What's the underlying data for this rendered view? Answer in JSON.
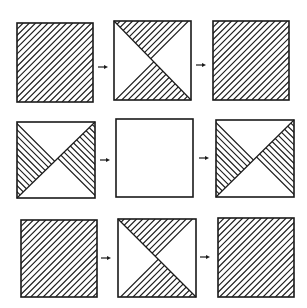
{
  "diagram": {
    "type": "pattern-matrix",
    "rows": 3,
    "cols": 3,
    "colors": {
      "stroke": "#1a1a1a",
      "background": "#ffffff"
    },
    "cells": [
      {
        "row": 0,
        "col": 0,
        "pattern": "full",
        "hatch": "forward",
        "box": [
          17,
          23,
          76,
          79
        ]
      },
      {
        "row": 0,
        "col": 1,
        "pattern": "top-bottom",
        "hatch": "forward",
        "diagonal": "tl-br",
        "box": [
          114,
          21,
          77,
          79
        ]
      },
      {
        "row": 0,
        "col": 2,
        "pattern": "full",
        "hatch": "forward",
        "box": [
          213,
          21,
          76,
          79
        ]
      },
      {
        "row": 1,
        "col": 0,
        "pattern": "left-right",
        "hatch": "back",
        "diagonal": "bl-tr",
        "box": [
          17,
          122,
          78,
          76
        ]
      },
      {
        "row": 1,
        "col": 1,
        "pattern": "empty",
        "box": [
          116,
          119,
          77,
          78
        ]
      },
      {
        "row": 1,
        "col": 2,
        "pattern": "left-right",
        "hatch": "back",
        "diagonal": "bl-tr",
        "box": [
          216,
          120,
          78,
          77
        ]
      },
      {
        "row": 2,
        "col": 0,
        "pattern": "full",
        "hatch": "forward",
        "box": [
          21,
          220,
          76,
          77
        ]
      },
      {
        "row": 2,
        "col": 1,
        "pattern": "top-bottom",
        "hatch": "forward",
        "diagonal": "tl-br",
        "box": [
          118,
          219,
          78,
          78
        ]
      },
      {
        "row": 2,
        "col": 2,
        "pattern": "full",
        "hatch": "forward",
        "box": [
          218,
          218,
          76,
          79
        ]
      }
    ],
    "arrows": [
      {
        "from": [
          0,
          0
        ],
        "to": [
          0,
          1
        ],
        "pos": [
          98,
          67
        ]
      },
      {
        "from": [
          0,
          1
        ],
        "to": [
          0,
          2
        ],
        "pos": [
          196,
          65
        ]
      },
      {
        "from": [
          1,
          0
        ],
        "to": [
          1,
          1
        ],
        "pos": [
          100,
          160
        ]
      },
      {
        "from": [
          1,
          1
        ],
        "to": [
          1,
          2
        ],
        "pos": [
          199,
          158
        ]
      },
      {
        "from": [
          2,
          0
        ],
        "to": [
          2,
          1
        ],
        "pos": [
          101,
          258
        ]
      },
      {
        "from": [
          2,
          1
        ],
        "to": [
          2,
          2
        ],
        "pos": [
          200,
          257
        ]
      }
    ]
  }
}
